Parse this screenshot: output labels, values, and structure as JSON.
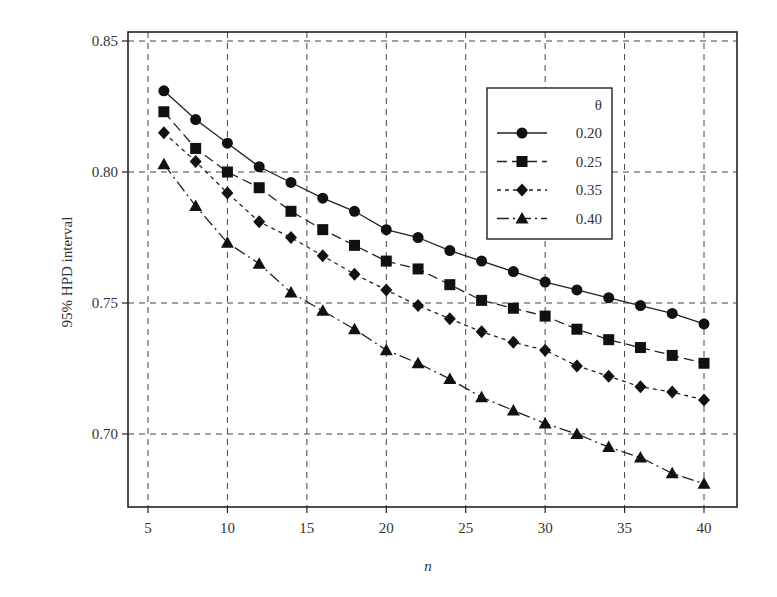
{
  "chart_data": {
    "type": "line",
    "title": "",
    "xlabel": "n",
    "ylabel": "95% HPD interval",
    "xlim": [
      3,
      42
    ],
    "ylim": [
      0.675,
      0.853
    ],
    "xticks": [
      5,
      10,
      15,
      20,
      25,
      30,
      35,
      40
    ],
    "yticks": [
      0.7,
      0.75,
      0.8,
      0.85
    ],
    "ytick_labels": [
      "0.70",
      "0.75",
      "0.80",
      "0.85"
    ],
    "grid": true,
    "legend_title": "θ",
    "legend_position": "upper right",
    "x": [
      6,
      8,
      10,
      12,
      14,
      16,
      18,
      20,
      22,
      24,
      26,
      28,
      30,
      32,
      34,
      36,
      38,
      40
    ],
    "series": [
      {
        "name": "0.20",
        "marker": "circle",
        "dash": "solid",
        "values": [
          0.831,
          0.82,
          0.811,
          0.802,
          0.796,
          0.79,
          0.785,
          0.778,
          0.775,
          0.77,
          0.766,
          0.762,
          0.758,
          0.755,
          0.752,
          0.749,
          0.746,
          0.742
        ]
      },
      {
        "name": "0.25",
        "marker": "square",
        "dash": "long-dash",
        "values": [
          0.823,
          0.809,
          0.8,
          0.794,
          0.785,
          0.778,
          0.772,
          0.766,
          0.763,
          0.757,
          0.751,
          0.748,
          0.745,
          0.74,
          0.736,
          0.733,
          0.73,
          0.727
        ]
      },
      {
        "name": "0.35",
        "marker": "diamond",
        "dash": "short-dash",
        "values": [
          0.815,
          0.804,
          0.792,
          0.781,
          0.775,
          0.768,
          0.761,
          0.755,
          0.749,
          0.744,
          0.739,
          0.735,
          0.732,
          0.726,
          0.722,
          0.718,
          0.716,
          0.713
        ]
      },
      {
        "name": "0.40",
        "marker": "triangle",
        "dash": "dash-dot",
        "values": [
          0.803,
          0.787,
          0.773,
          0.765,
          0.754,
          0.747,
          0.74,
          0.732,
          0.727,
          0.721,
          0.714,
          0.709,
          0.704,
          0.7,
          0.695,
          0.691,
          0.685,
          0.681
        ]
      }
    ]
  }
}
